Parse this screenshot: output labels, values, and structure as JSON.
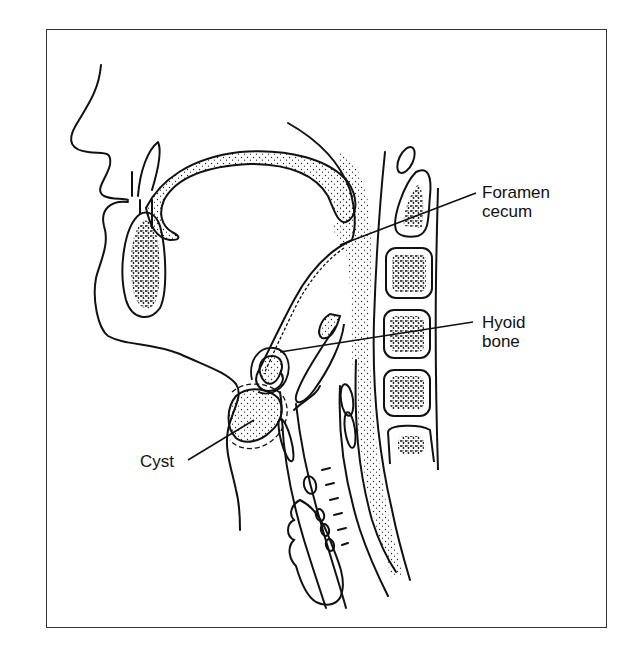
{
  "figure": {
    "frame_color": "#333333",
    "ink_color": "#111111"
  },
  "labels": {
    "foramen_cecum": {
      "line1": "Foramen",
      "line2": "cecum"
    },
    "hyoid_bone": {
      "line1": "Hyoid",
      "line2": "bone"
    },
    "cyst": {
      "text": "Cyst"
    }
  }
}
